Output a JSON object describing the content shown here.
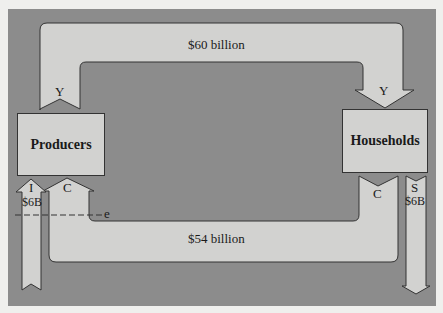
{
  "diagram": {
    "title": "",
    "nodes": {
      "producers": "Producers",
      "households": "Households"
    },
    "flows": {
      "income_amount": "$60 billion",
      "income_label_producers": "Y",
      "income_label_households": "Y",
      "consumption_amount": "$54 billion",
      "consumption_label_households": "C",
      "consumption_label_producers": "C",
      "investment_label": "I",
      "investment_amount": "$6B",
      "saving_label": "S",
      "saving_amount": "$6B",
      "equilibrium_marker": "e"
    },
    "colors": {
      "background_panel": "#8c8c8c",
      "arrow_fill": "#d2d2d0",
      "outline": "#333333",
      "page": "#efefed"
    }
  }
}
